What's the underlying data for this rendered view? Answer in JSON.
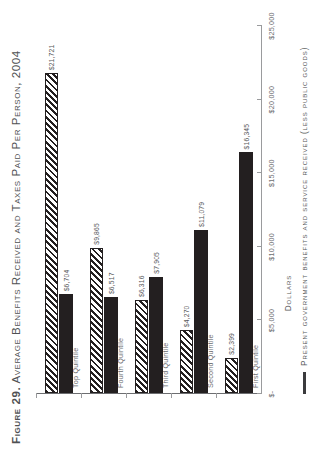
{
  "figure": {
    "number_label": "Figure 29.",
    "title": "Average Benefits Received and Taxes Paid Per Person, 2004"
  },
  "axis": {
    "value_axis_title": "Dollars",
    "tick_labels": [
      "$-",
      "$5,000",
      "$10,000",
      "$15,000",
      "$20,000",
      "$25,000"
    ],
    "tick_values": [
      0,
      5000,
      10000,
      15000,
      20000,
      25000
    ]
  },
  "legend": {
    "entries": [
      {
        "label": "Present government benefits and service received (less public goods)",
        "style": "line"
      }
    ]
  },
  "chart_data": {
    "type": "bar",
    "orientation": "horizontal",
    "title": "Figure 29. Average Benefits Received and Taxes Paid Per Person, 2004",
    "xlabel": "Dollars",
    "ylabel": "",
    "xlim": [
      0,
      25000
    ],
    "grid": false,
    "legend_position": "bottom-left",
    "categories": [
      "First Quintile",
      "Second Quintile",
      "Third Quintile",
      "Fourth Quintile",
      "Top Quintile"
    ],
    "series": [
      {
        "name": "Benefits received",
        "style": "solid",
        "values": [
          16345,
          11079,
          7905,
          6517,
          6704
        ],
        "value_labels": [
          "$16,345",
          "$11,079",
          "$7,905",
          "$6,517",
          "$6,704"
        ]
      },
      {
        "name": "Taxes paid",
        "style": "hatched",
        "values": [
          2399,
          4270,
          6316,
          9865,
          21721
        ],
        "value_labels": [
          "$2,399",
          "$4,270",
          "$6,316",
          "$9,865",
          "$21,721"
        ]
      }
    ]
  },
  "colors": {
    "solid_bar": "#231f20",
    "hatch_bar_line": "#231f20",
    "hatch_bar_fill": "#ffffff",
    "axis": "#9a9b9d",
    "text": "#58595b",
    "background": "#ffffff"
  }
}
